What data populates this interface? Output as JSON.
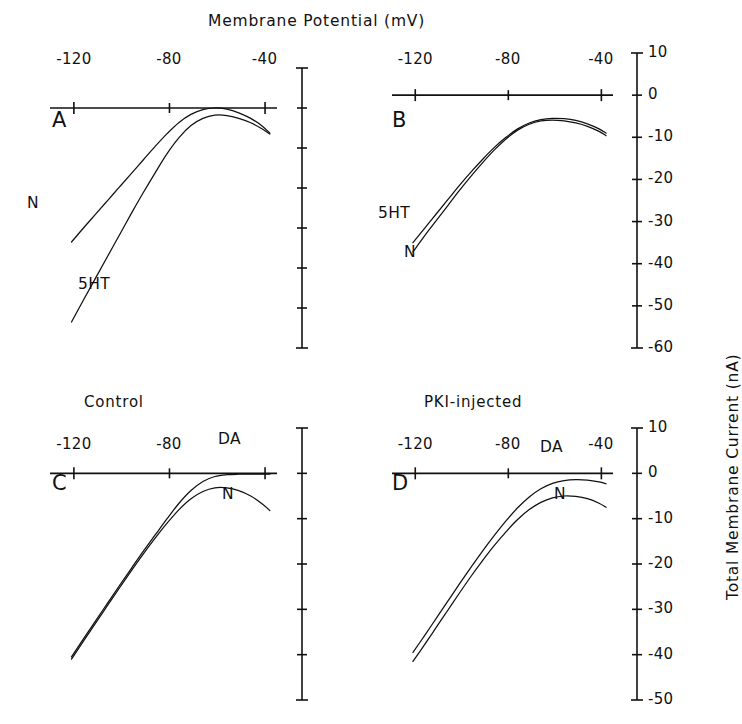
{
  "figure": {
    "title": "Membrane Potential (mV)",
    "y_axis_title": "Total Membrane Current (nA)"
  },
  "chart_data": {
    "type": "line",
    "title": "Membrane Potential (mV)",
    "xlabel": "Membrane Potential (mV)",
    "ylabel": "Total Membrane Current (nA)",
    "grid": false,
    "legend": "inline-curve-labels",
    "panels": [
      {
        "id": "A",
        "letter": "A",
        "caption": "",
        "xlim": [
          -130,
          -35
        ],
        "xticks": [
          -120,
          -80,
          -40
        ],
        "xticklabels": [
          "-120",
          "-80",
          "-40"
        ],
        "ylim": [
          -60,
          10
        ],
        "yticks": [
          10,
          0,
          -10,
          -20,
          -30,
          -40,
          -50,
          -60
        ],
        "yticklabels": [
          "",
          "",
          "",
          "",
          "",
          "",
          "",
          ""
        ],
        "y_axis_labeled": false,
        "series": [
          {
            "name": "N",
            "label": "N",
            "x": [
              -121,
              -116,
              -111,
              -106,
              -101,
              -96,
              -91,
              -86,
              -81,
              -76,
              -71,
              -66,
              -61,
              -56,
              -51,
              -46,
              -41,
              -38
            ],
            "y": [
              -33.5,
              -30.0,
              -26.6,
              -23.2,
              -19.8,
              -16.4,
              -13.0,
              -9.6,
              -6.4,
              -3.6,
              -1.6,
              -0.4,
              0.0,
              -0.3,
              -1.2,
              -2.6,
              -4.6,
              -6.3
            ]
          },
          {
            "name": "5HT",
            "label": "5HT",
            "x": [
              -121,
              -116,
              -111,
              -106,
              -101,
              -96,
              -91,
              -86,
              -81,
              -76,
              -71,
              -66,
              -61,
              -56,
              -51,
              -46,
              -41,
              -38
            ],
            "y": [
              -53.5,
              -48.0,
              -42.6,
              -37.2,
              -31.8,
              -26.4,
              -21.2,
              -16.2,
              -11.4,
              -7.4,
              -4.4,
              -2.6,
              -1.8,
              -1.9,
              -2.6,
              -3.7,
              -5.3,
              -6.5
            ]
          }
        ]
      },
      {
        "id": "B",
        "letter": "B",
        "caption": "",
        "xlim": [
          -130,
          -35
        ],
        "xticks": [
          -120,
          -80,
          -40
        ],
        "xticklabels": [
          "-120",
          "-80",
          "-40"
        ],
        "ylim": [
          -60,
          10
        ],
        "yticks": [
          10,
          0,
          -10,
          -20,
          -30,
          -40,
          -50,
          -60
        ],
        "yticklabels": [
          "10",
          "0",
          "-10",
          "-20",
          "-30",
          "-40",
          "-50",
          "-60"
        ],
        "y_axis_labeled": true,
        "series": [
          {
            "name": "5HT",
            "label": "5HT",
            "x": [
              -121,
              -116,
              -111,
              -106,
              -101,
              -96,
              -91,
              -86,
              -81,
              -76,
              -71,
              -66,
              -61,
              -56,
              -51,
              -46,
              -41,
              -38
            ],
            "y": [
              -35.0,
              -31.6,
              -28.2,
              -24.8,
              -21.4,
              -18.2,
              -15.2,
              -12.4,
              -10.0,
              -8.0,
              -6.6,
              -5.8,
              -5.5,
              -5.6,
              -6.0,
              -6.8,
              -8.0,
              -9.0
            ]
          },
          {
            "name": "N",
            "label": "N",
            "x": [
              -121,
              -116,
              -111,
              -106,
              -101,
              -96,
              -91,
              -86,
              -81,
              -76,
              -71,
              -66,
              -61,
              -56,
              -51,
              -46,
              -41,
              -38
            ],
            "y": [
              -37.2,
              -33.4,
              -29.8,
              -26.2,
              -22.6,
              -19.2,
              -16.0,
              -13.0,
              -10.4,
              -8.3,
              -6.9,
              -6.1,
              -5.9,
              -6.1,
              -6.6,
              -7.4,
              -8.6,
              -9.6
            ]
          }
        ]
      },
      {
        "id": "C",
        "letter": "C",
        "caption": "Control",
        "xlim": [
          -130,
          -35
        ],
        "xticks": [
          -120,
          -80,
          -40
        ],
        "xticklabels": [
          "-120",
          "-80",
          ""
        ],
        "ylim": [
          -50,
          10
        ],
        "yticks": [
          10,
          0,
          -10,
          -20,
          -30,
          -40,
          -50
        ],
        "yticklabels": [
          "",
          "",
          "",
          "",
          "",
          "",
          ""
        ],
        "y_axis_labeled": false,
        "series": [
          {
            "name": "DA",
            "label": "DA",
            "x": [
              -121,
              -116,
              -111,
              -106,
              -101,
              -96,
              -91,
              -86,
              -81,
              -76,
              -71,
              -66,
              -61,
              -56,
              -51,
              -46,
              -41,
              -38
            ],
            "y": [
              -40.5,
              -36.5,
              -32.6,
              -28.7,
              -24.8,
              -21.0,
              -17.2,
              -13.6,
              -10.0,
              -6.6,
              -3.8,
              -1.8,
              -0.7,
              -0.3,
              -0.2,
              -0.2,
              -0.2,
              -0.2
            ]
          },
          {
            "name": "N",
            "label": "N",
            "x": [
              -121,
              -116,
              -111,
              -106,
              -101,
              -96,
              -91,
              -86,
              -81,
              -76,
              -71,
              -66,
              -61,
              -56,
              -51,
              -46,
              -41,
              -38
            ],
            "y": [
              -41.0,
              -37.0,
              -33.1,
              -29.2,
              -25.3,
              -21.5,
              -17.8,
              -14.3,
              -11.0,
              -8.0,
              -5.6,
              -4.0,
              -3.2,
              -3.2,
              -3.8,
              -5.0,
              -6.8,
              -8.2
            ]
          }
        ]
      },
      {
        "id": "D",
        "letter": "D",
        "caption": "PKI-injected",
        "xlim": [
          -130,
          -35
        ],
        "xticks": [
          -120,
          -80,
          -40
        ],
        "xticklabels": [
          "-120",
          "-80",
          "-40"
        ],
        "ylim": [
          -50,
          10
        ],
        "yticks": [
          10,
          0,
          -10,
          -20,
          -30,
          -40,
          -50
        ],
        "yticklabels": [
          "10",
          "0",
          "-10",
          "-20",
          "-30",
          "-40",
          "-50"
        ],
        "y_axis_labeled": true,
        "series": [
          {
            "name": "DA",
            "label": "DA",
            "x": [
              -121,
              -116,
              -111,
              -106,
              -101,
              -96,
              -91,
              -86,
              -81,
              -76,
              -71,
              -66,
              -61,
              -56,
              -51,
              -46,
              -41,
              -38
            ],
            "y": [
              -39.5,
              -35.8,
              -32.0,
              -28.2,
              -24.4,
              -20.7,
              -17.1,
              -13.7,
              -10.5,
              -7.6,
              -5.2,
              -3.4,
              -2.2,
              -1.6,
              -1.4,
              -1.5,
              -1.9,
              -2.3
            ]
          },
          {
            "name": "N",
            "label": "N",
            "x": [
              -121,
              -116,
              -111,
              -106,
              -101,
              -96,
              -91,
              -86,
              -81,
              -76,
              -71,
              -66,
              -61,
              -56,
              -51,
              -46,
              -41,
              -38
            ],
            "y": [
              -41.5,
              -37.8,
              -34.0,
              -30.2,
              -26.4,
              -22.7,
              -19.2,
              -15.9,
              -12.9,
              -10.2,
              -8.0,
              -6.4,
              -5.4,
              -5.0,
              -5.1,
              -5.6,
              -6.6,
              -7.5
            ]
          }
        ]
      }
    ]
  }
}
